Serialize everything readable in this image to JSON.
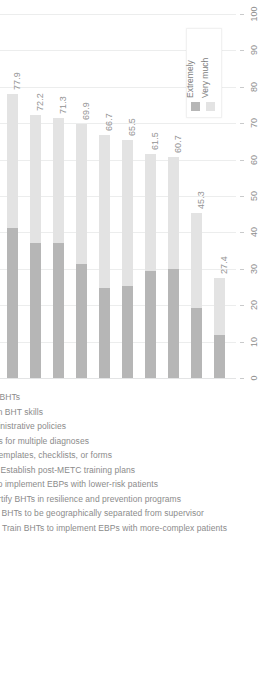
{
  "chart_data": {
    "type": "bar",
    "subtype": "stacked-bar-rotated",
    "title": "",
    "xlabel": "",
    "ylabel": "",
    "ylim": [
      0,
      100
    ],
    "ticks": [
      0,
      10,
      20,
      30,
      40,
      50,
      60,
      70,
      80,
      90,
      100
    ],
    "grid": true,
    "legend_position": "top-right",
    "categories": [
      "Professional development for BHTs",
      "Educate MHPs on BHT skills",
      "Establish administrative policies",
      "Train BHTs on treatments for multiple diagnoses",
      "Provide BHTs templates, checklists, or forms",
      "Establish post-METC training plans",
      "Train BHTs to implement EBPs with lower-risk patients",
      "Certify BHTs in resilience and prevention programs",
      "Prepare BHTs to be geographically separated from supervisor",
      "Train BHTs to implement EBPs with more-complex patients"
    ],
    "series": [
      {
        "name": "Extremely",
        "color": "#b6b6b6",
        "values": [
          41.3,
          37.2,
          37.0,
          31.2,
          24.6,
          25.3,
          29.3,
          30.0,
          19.2,
          11.9
        ]
      },
      {
        "name": "Very much",
        "color": "#e3e3e3",
        "values": [
          36.6,
          35.0,
          34.3,
          38.7,
          42.1,
          40.2,
          32.2,
          30.7,
          26.1,
          15.5
        ]
      }
    ],
    "totals": [
      77.9,
      72.2,
      71.3,
      69.9,
      66.7,
      65.5,
      61.5,
      60.7,
      45.3,
      27.4
    ],
    "total_labels": [
      "77.9",
      "72.2",
      "71.3",
      "69.9",
      "66.7",
      "65.5",
      "61.5",
      "60.7",
      "45.3",
      "27.4"
    ],
    "tick_labels": [
      "0",
      "10",
      "20",
      "30",
      "40",
      "50",
      "60",
      "70",
      "80",
      "90",
      "100"
    ]
  },
  "legend": {
    "items": [
      {
        "label": "Extremely",
        "color": "#b6b6b6"
      },
      {
        "label": "Very much",
        "color": "#e3e3e3"
      }
    ]
  }
}
